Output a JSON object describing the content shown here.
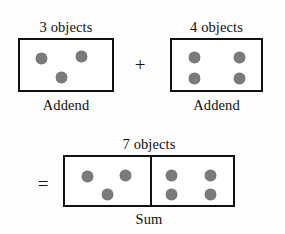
{
  "diagram": {
    "background_color": "#fdfdfd",
    "stroke_color": "#111111",
    "dot_color": "#7b7b7b"
  },
  "operators": {
    "plus": "+",
    "equals": "="
  },
  "addend_one": {
    "top_label": "3 objects",
    "bottom_label": "Addend",
    "count": 3,
    "dots": [
      {
        "x": 38,
        "y": 57
      },
      {
        "x": 78,
        "y": 55
      },
      {
        "x": 58,
        "y": 76
      }
    ]
  },
  "addend_two": {
    "top_label": "4 objects",
    "bottom_label": "Addend",
    "count": 4,
    "dots": [
      {
        "x": 192,
        "y": 55
      },
      {
        "x": 238,
        "y": 55
      },
      {
        "x": 192,
        "y": 76
      },
      {
        "x": 238,
        "y": 76
      }
    ]
  },
  "sum": {
    "top_label": "7 objects",
    "bottom_label": "Sum",
    "count": 7,
    "left_cell_count": 3,
    "right_cell_count": 4,
    "left_dots": [
      {
        "x": 85,
        "y": 173
      },
      {
        "x": 123,
        "y": 172
      },
      {
        "x": 105,
        "y": 192
      }
    ],
    "right_dots": [
      {
        "x": 177,
        "y": 173
      },
      {
        "x": 216,
        "y": 173
      },
      {
        "x": 177,
        "y": 192
      },
      {
        "x": 216,
        "y": 192
      }
    ]
  },
  "equation": {
    "expression": "3 + 4 = 7"
  }
}
